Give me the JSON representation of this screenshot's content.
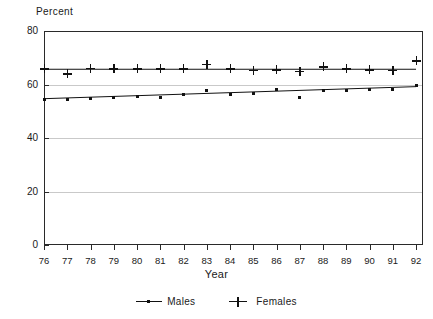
{
  "chart_data": {
    "type": "scatter",
    "title": "",
    "ylabel": "Percent",
    "xlabel": "Year",
    "ylim": [
      0,
      80
    ],
    "yticks": [
      0,
      20,
      40,
      60,
      80
    ],
    "xlim": [
      76,
      92
    ],
    "grid": true,
    "legend_position": "bottom-center",
    "categories": [
      "76",
      "77",
      "78",
      "79",
      "80",
      "81",
      "82",
      "83",
      "84",
      "85",
      "86",
      "87",
      "88",
      "89",
      "90",
      "91",
      "92"
    ],
    "x": [
      76,
      77,
      78,
      79,
      80,
      81,
      82,
      83,
      84,
      85,
      86,
      87,
      88,
      89,
      90,
      91,
      92
    ],
    "series": [
      {
        "name": "Males",
        "marker": "dot",
        "values": [
          54.5,
          54.3,
          54.6,
          55.0,
          55.6,
          55.1,
          56.3,
          57.6,
          56.4,
          56.5,
          58.2,
          55.0,
          57.6,
          57.6,
          58.0,
          58.3,
          59.5
        ],
        "trend_start": 54.7,
        "trend_end": 59.2
      },
      {
        "name": "Females",
        "marker": "plus",
        "values": [
          65.9,
          64.0,
          66.1,
          65.9,
          65.9,
          65.9,
          65.9,
          67.6,
          65.9,
          65.4,
          65.5,
          65.0,
          66.6,
          65.9,
          65.5,
          65.2,
          68.8
        ],
        "trend_start": 65.7,
        "trend_end": 65.7
      }
    ]
  },
  "axis": {
    "y_title": "Percent",
    "x_title": "Year",
    "ytick_labels": [
      "80",
      "60",
      "40",
      "20",
      "0"
    ],
    "xtick_labels": [
      "76",
      "77",
      "78",
      "79",
      "80",
      "81",
      "82",
      "83",
      "84",
      "85",
      "86",
      "87",
      "88",
      "89",
      "90",
      "91",
      "92"
    ]
  },
  "legend": {
    "items": [
      {
        "label": "Males",
        "symbol": "line-dot-marker"
      },
      {
        "label": "Females",
        "symbol": "plus-marker"
      }
    ]
  },
  "colors": {
    "ink": "#111111",
    "grid": "#c9c9c9",
    "frame": "#2a2a2a",
    "background": "#ffffff"
  }
}
